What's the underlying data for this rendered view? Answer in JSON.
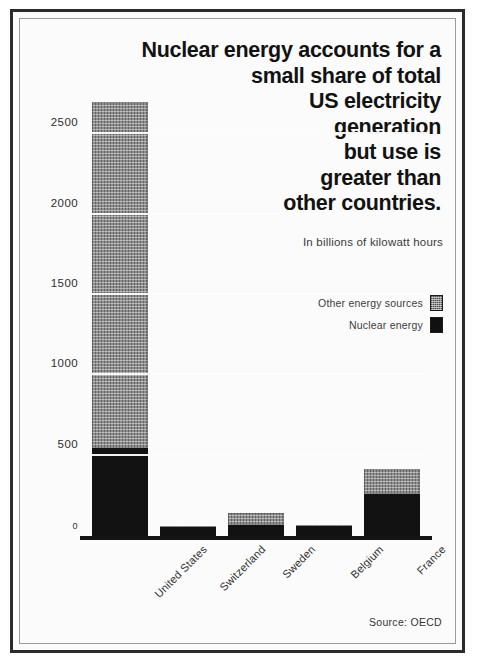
{
  "figure": {
    "title_lines": [
      "Nuclear energy accounts for a",
      "small share of total",
      "US electricity",
      "generation",
      "but use is",
      "greater than",
      "other countries."
    ],
    "subtitle": "In billions of kilowatt hours",
    "source": "Source: OECD",
    "legend": [
      {
        "label": "Other energy sources",
        "swatch": "hatched-gray-swatch",
        "color": "#8f8f8f"
      },
      {
        "label": "Nuclear energy",
        "swatch": "solid-black-swatch",
        "color": "#121212"
      }
    ]
  },
  "chart_data": {
    "type": "bar",
    "stacked": true,
    "title": "Nuclear energy accounts for a small share of total US electricity generation but use is greater than other countries.",
    "subtitle": "In billions of kilowatt hours",
    "xlabel": "",
    "ylabel": "In billions of kilowatt hours",
    "ylim": [
      0,
      2800
    ],
    "yticks": [
      0,
      500,
      1000,
      1500,
      2000,
      2500
    ],
    "ytick_labels": [
      "0",
      "500",
      "1000",
      "1500",
      "2000",
      "2500"
    ],
    "grid": true,
    "legend_position": "upper-right",
    "categories": [
      "United States",
      "Switzerland",
      "Sweden",
      "Belgium",
      "France"
    ],
    "series": [
      {
        "name": "Nuclear energy",
        "color": "#121212",
        "values": [
          545,
          55,
          70,
          65,
          260
        ]
      },
      {
        "name": "Other energy sources",
        "color": "#8f8f8f",
        "values": [
          2155,
          5,
          75,
          5,
          160
        ]
      }
    ],
    "totals": [
      2700,
      60,
      145,
      70,
      420
    ],
    "source": "Source: OECD"
  }
}
